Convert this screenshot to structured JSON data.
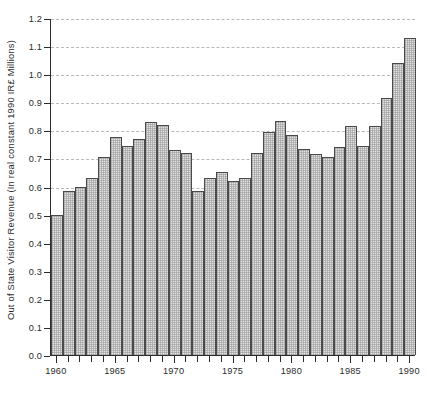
{
  "chart_data": {
    "type": "bar",
    "title": "",
    "xlabel": "",
    "ylabel": "Out of State Visitor Revenue (In real constant 1990 IR£ Millions)",
    "ylim": [
      0.0,
      1.2
    ],
    "ytick_step": 0.1,
    "grid": true,
    "legend": null,
    "xlim": [
      1959.5,
      1990.5
    ],
    "xtick_labels": [
      "1960",
      "1965",
      "1970",
      "1975",
      "1980",
      "1985",
      "1990"
    ],
    "xtick_values": [
      1960,
      1965,
      1970,
      1975,
      1980,
      1985,
      1990
    ],
    "ytick_labels": [
      "0.0",
      "0.1",
      "0.2",
      "0.3",
      "0.4",
      "0.5",
      "0.6",
      "0.7",
      "0.8",
      "0.9",
      "1.0",
      "1.1",
      "1.2"
    ],
    "ytick_values": [
      0.0,
      0.1,
      0.2,
      0.3,
      0.4,
      0.5,
      0.6,
      0.7,
      0.8,
      0.9,
      1.0,
      1.1,
      1.2
    ],
    "categories": [
      1960,
      1961,
      1962,
      1963,
      1964,
      1965,
      1966,
      1967,
      1968,
      1969,
      1970,
      1971,
      1972,
      1973,
      1974,
      1975,
      1976,
      1977,
      1978,
      1979,
      1980,
      1981,
      1982,
      1983,
      1984,
      1985,
      1986,
      1987,
      1988,
      1989,
      1990
    ],
    "values": [
      0.5,
      0.585,
      0.6,
      0.63,
      0.705,
      0.775,
      0.745,
      0.77,
      0.83,
      0.82,
      0.73,
      0.72,
      0.585,
      0.63,
      0.65,
      0.62,
      0.63,
      0.72,
      0.795,
      0.835,
      0.785,
      0.735,
      0.715,
      0.705,
      0.74,
      0.815,
      0.745,
      0.815,
      0.915,
      1.04,
      1.13
    ],
    "colors": {
      "bar_fill": "#e2e2e2",
      "bar_edge": "#4a4a4a",
      "axis": "#2a2a2a",
      "gridline": "#b9b9b9",
      "text": "#2b2b2b",
      "background": "#ffffff"
    }
  }
}
